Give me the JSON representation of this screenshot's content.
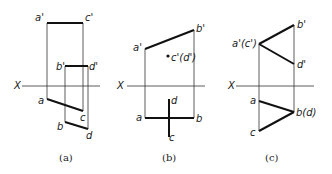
{
  "figure": {
    "panels": [
      {
        "id": "a",
        "caption": "(a)",
        "axis_label": "X",
        "labels": {
          "a_prime": "a'",
          "c_prime": "c'",
          "b_prime": "b'",
          "d_prime": "d'",
          "a": "a",
          "c": "c",
          "b": "b",
          "d": "d"
        }
      },
      {
        "id": "b",
        "caption": "(b)",
        "axis_label": "X",
        "labels": {
          "a_prime": "a'",
          "b_prime": "b'",
          "cd_prime": "c'(d')",
          "a": "a",
          "b": "b",
          "d": "d",
          "c": "c"
        }
      },
      {
        "id": "c",
        "caption": "(c)",
        "axis_label": "X",
        "labels": {
          "ac_prime": "a'(c')",
          "b_prime": "b'",
          "d_prime": "d'",
          "a": "a",
          "bd": "b(d)",
          "c": "c"
        }
      }
    ]
  }
}
